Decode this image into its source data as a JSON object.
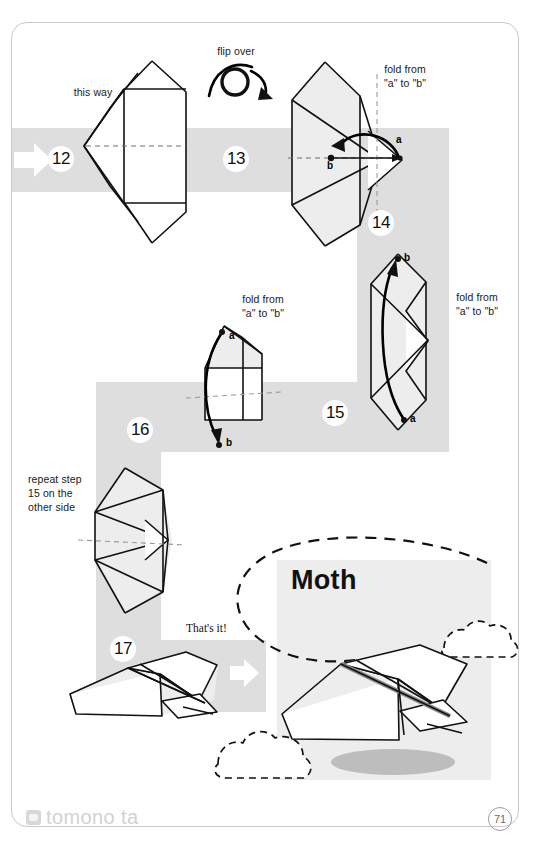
{
  "page": {
    "number": "71",
    "watermark": "tomono ta",
    "watermark_icon": "photo-icon"
  },
  "title": {
    "model_name": "Moth"
  },
  "annotations": {
    "this_way": "this way",
    "flip_over": "flip over",
    "fold_a_to_b": "fold from\n\"a\" to \"b\"",
    "repeat_step": "repeat step\n15 on the\nother side",
    "thats_it": "That's it!"
  },
  "steps": [
    {
      "number": "12",
      "label": "step-12"
    },
    {
      "number": "13",
      "label": "step-13"
    },
    {
      "number": "14",
      "label": "step-14"
    },
    {
      "number": "15",
      "label": "step-15"
    },
    {
      "number": "16",
      "label": "step-16"
    },
    {
      "number": "17",
      "label": "step-17"
    }
  ],
  "point_labels": {
    "a": "a",
    "b": "b"
  },
  "colors": {
    "band_gray": "#dedede",
    "panel_gray": "#ededed",
    "ink": "#111111",
    "page_border": "#c9c9c9",
    "watermark": "#d2d2d2"
  }
}
